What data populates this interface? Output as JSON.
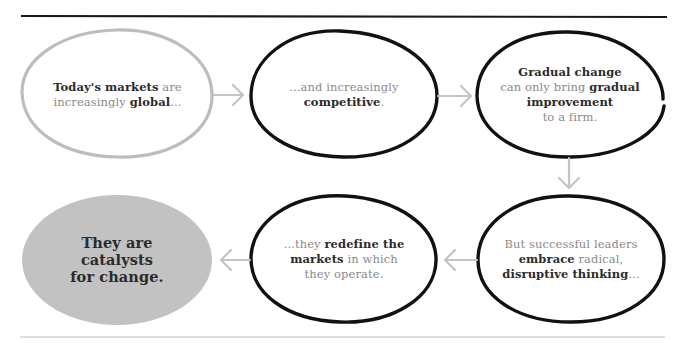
{
  "diagram": {
    "type": "flow",
    "direction": "left-to-right then down then right-to-left",
    "colors": {
      "rule_top": "#1a1a1a",
      "rule_bottom": "#bdbdbd",
      "outline_dark": "#111111",
      "outline_light": "#bdbdbd",
      "arrow": "#c4c4c4",
      "final_fill": "#c2c2c2",
      "text_regular": "#8a8a8a",
      "text_bold": "#2b2b2b"
    },
    "nodes": [
      {
        "id": "markets-global",
        "style": "light-outline",
        "lines": [
          [
            {
              "t": "Today's markets",
              "b": true
            },
            {
              "t": " are",
              "b": false
            }
          ],
          [
            {
              "t": "increasingly ",
              "b": false
            },
            {
              "t": "global",
              "b": true
            },
            {
              "t": "...",
              "b": false
            }
          ]
        ]
      },
      {
        "id": "competitive",
        "style": "dark-outline",
        "lines": [
          [
            {
              "t": "...and increasingly",
              "b": false
            }
          ],
          [
            {
              "t": "competitive",
              "b": true
            },
            {
              "t": ".",
              "b": false
            }
          ]
        ]
      },
      {
        "id": "gradual-change",
        "style": "dark-outline",
        "lines": [
          [
            {
              "t": "Gradual change",
              "b": true
            }
          ],
          [
            {
              "t": "can only bring ",
              "b": false
            },
            {
              "t": "gradual",
              "b": true
            }
          ],
          [
            {
              "t": "improvement",
              "b": true
            }
          ],
          [
            {
              "t": "to a firm.",
              "b": false
            }
          ]
        ]
      },
      {
        "id": "disruptive-thinking",
        "style": "dark-outline",
        "lines": [
          [
            {
              "t": "But successful leaders",
              "b": false
            }
          ],
          [
            {
              "t": "embrace",
              "b": true
            },
            {
              "t": " radical,",
              "b": false
            }
          ],
          [
            {
              "t": "disruptive thinking",
              "b": true
            },
            {
              "t": "...",
              "b": false
            }
          ]
        ]
      },
      {
        "id": "redefine-markets",
        "style": "dark-outline",
        "lines": [
          [
            {
              "t": "...they ",
              "b": false
            },
            {
              "t": "redefine the",
              "b": true
            }
          ],
          [
            {
              "t": "markets",
              "b": true
            },
            {
              "t": " in which",
              "b": false
            }
          ],
          [
            {
              "t": "they operate.",
              "b": false
            }
          ]
        ]
      },
      {
        "id": "catalysts",
        "style": "filled-gray",
        "lines": [
          [
            {
              "t": "They are",
              "b": true
            }
          ],
          [
            {
              "t": "catalysts",
              "b": true
            }
          ],
          [
            {
              "t": "for change.",
              "b": true
            }
          ]
        ]
      }
    ],
    "edges": [
      {
        "from": "markets-global",
        "to": "competitive",
        "direction": "right"
      },
      {
        "from": "competitive",
        "to": "gradual-change",
        "direction": "right"
      },
      {
        "from": "gradual-change",
        "to": "disruptive-thinking",
        "direction": "down"
      },
      {
        "from": "disruptive-thinking",
        "to": "redefine-markets",
        "direction": "left"
      },
      {
        "from": "redefine-markets",
        "to": "catalysts",
        "direction": "left"
      }
    ]
  }
}
